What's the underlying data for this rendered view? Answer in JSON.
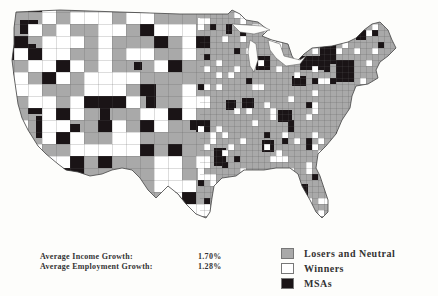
{
  "map": {
    "title": "",
    "region": "Continental United States (counties)",
    "categories": [
      {
        "key": "losers",
        "label": "Losers and Neutral",
        "color": "#a9a9a9"
      },
      {
        "key": "winners",
        "label": "Winners",
        "color": "#ffffff"
      },
      {
        "key": "msas",
        "label": "MSAs",
        "color": "#1a1416"
      }
    ],
    "border_color": "#555555"
  },
  "stats": [
    {
      "label": "Average Income Growth:",
      "value": "1.70%"
    },
    {
      "label": "Average Employment Growth:",
      "value": "1.28%"
    }
  ],
  "legend": {
    "items": [
      {
        "label": "Losers and Neutral",
        "color": "#a9a9a9"
      },
      {
        "label": "Winners",
        "color": "#ffffff"
      },
      {
        "label": "MSAs",
        "color": "#1a1416"
      }
    ]
  }
}
